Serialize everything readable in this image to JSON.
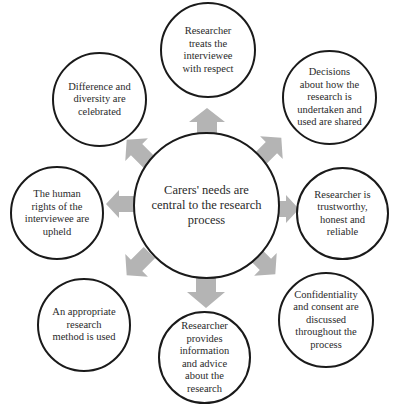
{
  "diagram": {
    "center": {
      "label": "Carers' needs are\ncentral to the research\nprocess"
    },
    "nodes": [
      {
        "id": "top",
        "label": "Researcher\ntreats the\ninterviewee\nwith respect"
      },
      {
        "id": "upper-right",
        "label": "Decisions\nabout how the\nresearch is\nundertaken and\nused are shared"
      },
      {
        "id": "right",
        "label": "Researcher is\ntrustworthy,\nhonest and\nreliable"
      },
      {
        "id": "lower-right",
        "label": "Confidentiality\nand consent are\ndiscussed\nthroughout the\nprocess"
      },
      {
        "id": "bottom",
        "label": "Researcher\nprovides\ninformation\nand advice\nabout the\nresearch"
      },
      {
        "id": "lower-left",
        "label": "An appropriate\nresearch\nmethod is used"
      },
      {
        "id": "left",
        "label": "The human\nrights of the\ninterviewee are\nupheld"
      },
      {
        "id": "upper-left",
        "label": "Difference and\ndiversity are\ncelebrated"
      }
    ],
    "arrows": [
      {
        "direction": "up"
      },
      {
        "direction": "up-right"
      },
      {
        "direction": "right"
      },
      {
        "direction": "down-right"
      },
      {
        "direction": "down"
      },
      {
        "direction": "down-left"
      },
      {
        "direction": "left"
      },
      {
        "direction": "up-left"
      }
    ],
    "colors": {
      "arrow_fill": "#b4b4b4",
      "circle_stroke": "#1a1a1a",
      "text": "#2a2a2a",
      "background": "#ffffff"
    }
  }
}
